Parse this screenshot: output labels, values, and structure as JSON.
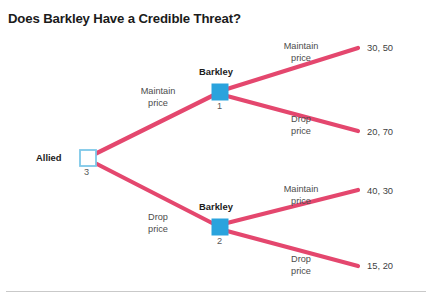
{
  "figure": {
    "title": "Does Barkley Have a Credible Threat?",
    "colors": {
      "branch": "#e4476e",
      "node_fill": "#2aa3dd",
      "node_stroke": "#7ec8e8",
      "text": "#1b1b1b",
      "rule": "#c9c9c9",
      "background": "#ffffff"
    }
  },
  "nodes": [
    {
      "id": "allied",
      "player": "Allied",
      "number": "3",
      "shape": "hollow-square",
      "x": 88,
      "y": 158
    },
    {
      "id": "barkley1",
      "player": "Barkley",
      "number": "1",
      "shape": "filled-square",
      "x": 220,
      "y": 92
    },
    {
      "id": "barkley2",
      "player": "Barkley",
      "number": "2",
      "shape": "filled-square",
      "x": 220,
      "y": 227
    }
  ],
  "branches": [
    {
      "id": "allied-maintain",
      "label_line1": "Maintain",
      "label_line2": "price",
      "from": "allied",
      "to": "barkley1"
    },
    {
      "id": "allied-drop",
      "label_line1": "Drop",
      "label_line2": "price",
      "from": "allied",
      "to": "barkley2"
    },
    {
      "id": "barkley1-maintain",
      "label_line1": "Maintain",
      "label_line2": "price",
      "from": "barkley1",
      "to": "payoff1"
    },
    {
      "id": "barkley1-drop",
      "label_line1": "Drop",
      "label_line2": "price",
      "from": "barkley1",
      "to": "payoff2"
    },
    {
      "id": "barkley2-maintain",
      "label_line1": "Maintain",
      "label_line2": "price",
      "from": "barkley2",
      "to": "payoff3"
    },
    {
      "id": "barkley2-drop",
      "label_line1": "Drop",
      "label_line2": "price",
      "from": "barkley2",
      "to": "payoff4"
    }
  ],
  "payoffs": [
    {
      "id": "payoff1",
      "text": "30, 50"
    },
    {
      "id": "payoff2",
      "text": "20, 70"
    },
    {
      "id": "payoff3",
      "text": "40, 30"
    },
    {
      "id": "payoff4",
      "text": "15, 20"
    }
  ]
}
